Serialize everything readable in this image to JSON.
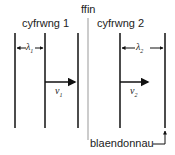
{
  "diagram": {
    "barrier_label": "ffin",
    "wave1": {
      "label": "cyfrwng 1",
      "wavelength_symbol": "λ",
      "wavelength_sub": "1",
      "velocity_symbol": "v",
      "velocity_sub": "1"
    },
    "wave2": {
      "label": "cyfrwng 2",
      "wavelength_symbol": "λ",
      "wavelength_sub": "2",
      "velocity_symbol": "v",
      "velocity_sub": "2"
    },
    "wavefront_label": "blaendonnau"
  }
}
